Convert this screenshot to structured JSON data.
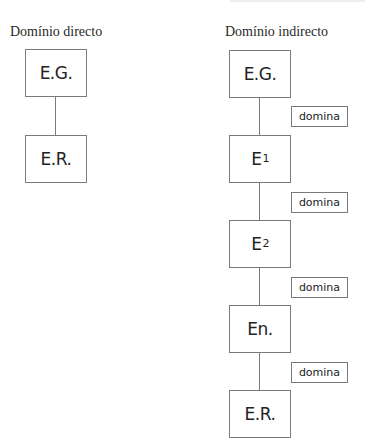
{
  "direct_domain": {
    "heading": "Domínio directo",
    "nodes": [
      {
        "label": "E.G."
      },
      {
        "label": "E.R."
      }
    ]
  },
  "indirect_domain": {
    "heading": "Domínio indirecto",
    "nodes": [
      {
        "label": "E.G.",
        "sub": ""
      },
      {
        "label": "E",
        "sub": "1"
      },
      {
        "label": "E",
        "sub": "2"
      },
      {
        "label": "En.",
        "sub": ""
      },
      {
        "label": "E.R.",
        "sub": ""
      }
    ],
    "relation_label": "domina",
    "relations": [
      {
        "label": "domina"
      },
      {
        "label": "domina"
      },
      {
        "label": "domina"
      },
      {
        "label": "domina"
      }
    ]
  },
  "colors": {
    "border": "#7a7a7a",
    "text": "#222222",
    "background": "#ffffff"
  }
}
